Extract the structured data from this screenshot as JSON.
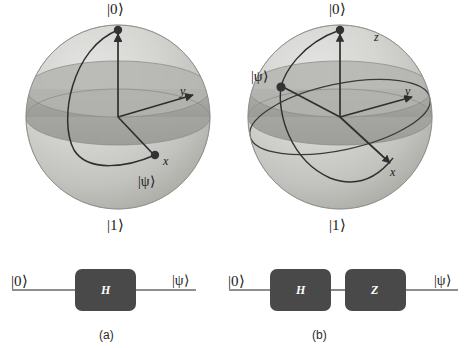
{
  "figure": {
    "panels": [
      {
        "id": "a",
        "caption": "(a)",
        "sphere": {
          "north_label": "|0⟩",
          "south_label": "|1⟩",
          "state_label": "|ψ⟩",
          "axes": [
            {
              "name": "x-axis-label",
              "text": "x"
            },
            {
              "name": "y-axis-label",
              "text": "y"
            },
            {
              "name": "z-axis-label",
              "text": ""
            }
          ],
          "state_position": "x-axis (equator, +x)",
          "arc": "meridian from |0⟩ to +x"
        },
        "circuit": {
          "input_label": "|0⟩",
          "output_label": "|ψ⟩",
          "gates": [
            "H"
          ]
        }
      },
      {
        "id": "b",
        "caption": "(b)",
        "sphere": {
          "north_label": "|0⟩",
          "south_label": "|1⟩",
          "state_label": "|ψ⟩",
          "axes": [
            {
              "name": "x-axis-label",
              "text": "x"
            },
            {
              "name": "y-axis-label",
              "text": "y"
            },
            {
              "name": "z-axis-label",
              "text": "z"
            }
          ],
          "state_position": "equator, −x direction",
          "arc": "meridian from |0⟩ to −x"
        },
        "circuit": {
          "input_label": "|0⟩",
          "output_label": "|ψ⟩",
          "gates": [
            "H",
            "Z"
          ]
        }
      }
    ],
    "colors": {
      "sphere_light": "#d6d6d4",
      "sphere_mid": "#b7b7b4",
      "sphere_dark": "#9d9d99",
      "equator_disc": "#a9a9a5",
      "stroke": "#2f2f2f",
      "gate_fill": "#494949",
      "gate_text": "#ffffff",
      "wire": "#6a6a6a",
      "text": "#1a1a1a"
    }
  }
}
